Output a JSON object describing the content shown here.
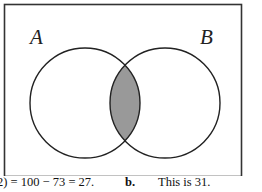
{
  "diagram": {
    "type": "venn",
    "universe": {
      "x": 4,
      "y": 4,
      "width": 237,
      "height": 172
    },
    "sets": [
      {
        "label": "A",
        "cx": 85,
        "cy": 103,
        "r": 55,
        "label_x": 30,
        "label_y": 44
      },
      {
        "label": "B",
        "cx": 165,
        "cy": 103,
        "r": 55,
        "label_x": 200,
        "label_y": 44
      }
    ],
    "shaded_region": "A ∩ B",
    "colors": {
      "stroke": "#222222",
      "shade": "#999999",
      "background": "#ffffff"
    }
  },
  "caption": {
    "left_text": "2) = 100 − 73 = 27.",
    "part_label": "b.",
    "right_text": "This is 31."
  }
}
